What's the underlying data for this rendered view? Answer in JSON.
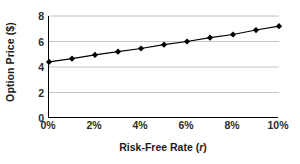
{
  "chart_data": {
    "type": "line",
    "title": "",
    "xlabel": "Risk-Free Rate (r)",
    "xlabel_plain": "Risk-Free Rate",
    "xlabel_variable": "r",
    "ylabel": "Option Price ($)",
    "x": [
      0,
      1,
      2,
      3,
      4,
      5,
      6,
      7,
      8,
      9,
      10
    ],
    "x_tick_labels": [
      "0%",
      "2%",
      "4%",
      "6%",
      "8%",
      "10%"
    ],
    "x_tick_values": [
      0,
      2,
      4,
      6,
      8,
      10
    ],
    "xlim": [
      0,
      10
    ],
    "y_tick_labels": [
      "0",
      "2",
      "4",
      "6",
      "8"
    ],
    "y_tick_values": [
      0,
      2,
      4,
      6,
      8
    ],
    "ylim": [
      0,
      8
    ],
    "grid": "horizontal",
    "legend": "none",
    "series": [
      {
        "name": "Option Price",
        "marker": "diamond",
        "marker_color": "#000000",
        "line_color": "#000000",
        "values": [
          4.4,
          4.65,
          4.95,
          5.2,
          5.45,
          5.75,
          6.0,
          6.3,
          6.55,
          6.9,
          7.2
        ]
      }
    ],
    "colors": {
      "axis": "#000000",
      "gridline": "#c0c0c0",
      "text": "#2b2b2b",
      "background": "#ffffff"
    }
  }
}
